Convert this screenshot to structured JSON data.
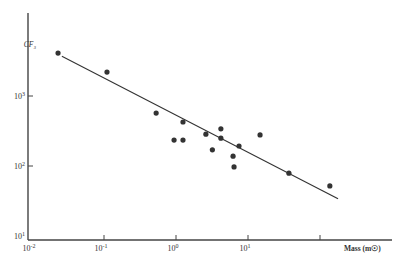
{
  "chart_data": {
    "type": "scatter",
    "title": "",
    "xlabel": "Mass (m☉)",
    "ylabel": "CF₃",
    "xscale": "log",
    "yscale": "log",
    "xlim": [
      0.01,
      1000
    ],
    "ylim": [
      10,
      10000
    ],
    "grid": false,
    "legend": null,
    "x_ticks": [
      {
        "value": 0.01,
        "label": "10",
        "exp": "-2"
      },
      {
        "value": 0.1,
        "label": "10",
        "exp": "-1"
      },
      {
        "value": 1,
        "label": "10",
        "exp": "0"
      },
      {
        "value": 10,
        "label": "10",
        "exp": "1"
      },
      {
        "value": 100,
        "label": "",
        "exp": ""
      }
    ],
    "y_ticks": [
      {
        "value": 10,
        "label": "10",
        "exp": "1"
      },
      {
        "value": 100,
        "label": "10",
        "exp": "2"
      },
      {
        "value": 1000,
        "label": "10",
        "exp": "3"
      }
    ],
    "series": [
      {
        "name": "observations",
        "style": "points",
        "x": [
          0.023,
          0.11,
          0.53,
          1.25,
          0.94,
          1.25,
          2.6,
          4.2,
          4.2,
          3.2,
          7.5,
          6.2,
          6.4,
          14.7,
          37,
          137
        ],
        "y": [
          4100,
          2200,
          570,
          425,
          235,
          235,
          285,
          340,
          250,
          170,
          193,
          138,
          97,
          278,
          79,
          52
        ]
      },
      {
        "name": "fit",
        "style": "line",
        "x": [
          0.026,
          178
        ],
        "y": [
          3700,
          34
        ]
      }
    ]
  }
}
